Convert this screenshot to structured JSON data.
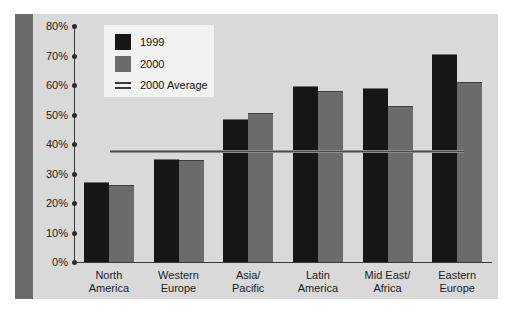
{
  "chart_data": {
    "type": "bar",
    "title": "",
    "subtitle": "",
    "xlabel": "",
    "ylabel": "",
    "ylim": [
      0,
      80
    ],
    "ytick_labels": [
      "80%",
      "70%",
      "60%",
      "50%",
      "40%",
      "30%",
      "20%",
      "10%",
      "0%"
    ],
    "ytick_values": [
      80,
      70,
      60,
      50,
      40,
      30,
      20,
      10,
      0
    ],
    "grid": false,
    "legend_position": "upper-left-inside",
    "categories": [
      "North\nAmerica",
      "Western\nEurope",
      "Asia/\nPacific",
      "Latin\nAmerica",
      "Mid East/\nAfrica",
      "Eastern\nEurope"
    ],
    "series": [
      {
        "name": "1999",
        "color": "#161616",
        "values": [
          27,
          35,
          48.5,
          59.5,
          59,
          70.5
        ]
      },
      {
        "name": "2000",
        "color": "#6b6b6b",
        "values": [
          26,
          34.5,
          50.5,
          58,
          53,
          61
        ]
      }
    ],
    "reference_line": {
      "label": "2000 Average",
      "value": 37.5,
      "color": "#4a4a4a",
      "orientation": "horizontal"
    }
  },
  "legend": {
    "items": [
      {
        "label": "1999",
        "swatch": "black-square-swatch"
      },
      {
        "label": "2000",
        "swatch": "gray-square-swatch"
      },
      {
        "label": "2000 Average",
        "swatch": "average-line-swatch"
      }
    ]
  },
  "colors": {
    "panel_background": "#d9d9d9",
    "accent_band": "#6b6b6b",
    "legend_background": "#f2f2f2",
    "axis": "#3a3a3a",
    "text": "#1c1c1c"
  }
}
